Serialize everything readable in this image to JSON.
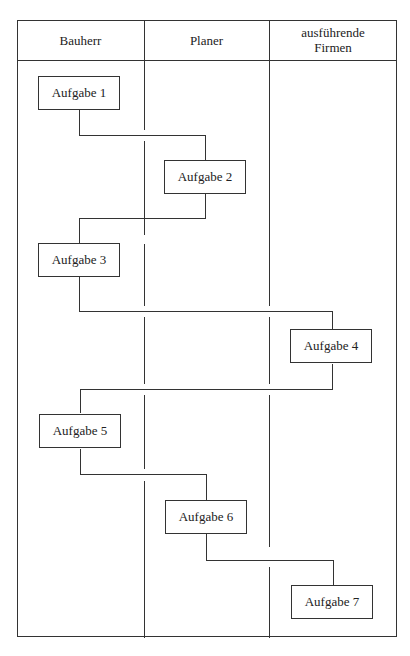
{
  "diagram": {
    "type": "swimlane",
    "lanes": [
      {
        "label": "Bauherr"
      },
      {
        "label": "Planer"
      },
      {
        "label": "ausführende\nFirmen"
      }
    ],
    "tasks": [
      {
        "label": "Aufgabe 1",
        "lane": "Bauherr"
      },
      {
        "label": "Aufgabe 2",
        "lane": "Planer"
      },
      {
        "label": "Aufgabe 3",
        "lane": "Bauherr"
      },
      {
        "label": "Aufgabe 4",
        "lane": "ausführende Firmen"
      },
      {
        "label": "Aufgabe 5",
        "lane": "Bauherr"
      },
      {
        "label": "Aufgabe 6",
        "lane": "Planer"
      },
      {
        "label": "Aufgabe 7",
        "lane": "ausführende Firmen"
      }
    ],
    "connections": [
      [
        "Aufgabe 1",
        "Aufgabe 2"
      ],
      [
        "Aufgabe 2",
        "Aufgabe 3"
      ],
      [
        "Aufgabe 3",
        "Aufgabe 4"
      ],
      [
        "Aufgabe 4",
        "Aufgabe 5"
      ],
      [
        "Aufgabe 5",
        "Aufgabe 6"
      ],
      [
        "Aufgabe 6",
        "Aufgabe 7"
      ]
    ]
  }
}
